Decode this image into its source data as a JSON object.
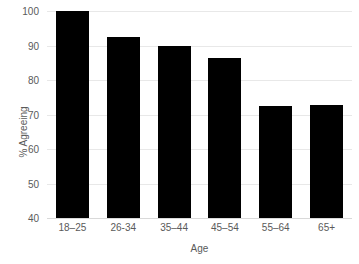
{
  "chart_data": {
    "type": "bar",
    "title": "",
    "subtitle": "",
    "categories": [
      "18–25",
      "26-34",
      "35–44",
      "45–54",
      "55–64",
      "65+"
    ],
    "values": [
      100,
      92.5,
      89.8,
      86.5,
      72.4,
      72.8
    ],
    "series": [
      {
        "name": "% Agreeing",
        "values": [
          100,
          92.5,
          89.8,
          86.5,
          72.4,
          72.8
        ]
      }
    ],
    "xlabel": "Age",
    "ylabel": "% Agreeing",
    "ylim": [
      40,
      100
    ],
    "yticks": [
      40,
      50,
      60,
      70,
      80,
      90,
      100
    ],
    "ytick_labels": [
      "40",
      "50",
      "60",
      "70",
      "80",
      "90",
      "100"
    ],
    "grid": true,
    "grid_axis": "y",
    "legend": false,
    "legend_position": "none",
    "bar_color": "#000000",
    "grid_color": "#e8e8e8",
    "text_color": "#5a5a5a",
    "background_color": "#ffffff",
    "annotations": []
  }
}
